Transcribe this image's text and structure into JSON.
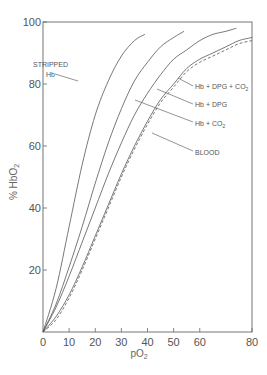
{
  "chart_data": {
    "type": "line",
    "title": "",
    "xlabel": "pO2",
    "ylabel": "% HbO2",
    "xlim": [
      0,
      80
    ],
    "ylim": [
      0,
      100
    ],
    "x_ticks": [
      0,
      10,
      20,
      30,
      40,
      50,
      60,
      80
    ],
    "y_ticks": [
      20,
      40,
      60,
      80,
      100
    ],
    "grid": false,
    "series": [
      {
        "name": "STRIPPED Hb",
        "style": "solid",
        "x": [
          0,
          5,
          10,
          15,
          20,
          25,
          30,
          35,
          39
        ],
        "y": [
          0,
          14,
          34,
          54,
          70,
          81,
          89,
          94,
          96
        ]
      },
      {
        "name": "Hb + CO2",
        "style": "solid",
        "x": [
          0,
          5,
          10,
          15,
          20,
          25,
          30,
          35,
          40,
          45,
          50,
          54
        ],
        "y": [
          0,
          9,
          21,
          34,
          48,
          61,
          72,
          81,
          87,
          92,
          95,
          97
        ]
      },
      {
        "name": "Hb + DPG",
        "style": "solid",
        "x": [
          0,
          5,
          10,
          15,
          20,
          25,
          30,
          35,
          40,
          45,
          50,
          55,
          60,
          65,
          70,
          74
        ],
        "y": [
          0,
          8,
          18,
          29,
          40,
          51,
          61,
          70,
          77,
          83,
          88,
          91,
          94,
          96,
          97,
          98
        ]
      },
      {
        "name": "Hb + DPG + CO2",
        "style": "solid",
        "x": [
          0,
          5,
          10,
          15,
          20,
          25,
          30,
          35,
          40,
          45,
          50,
          55,
          60,
          65,
          70,
          75,
          80
        ],
        "y": [
          0,
          5,
          12,
          21,
          31,
          41,
          51,
          60,
          68,
          75,
          80,
          85,
          88,
          90,
          92,
          94,
          95
        ]
      },
      {
        "name": "BLOOD",
        "style": "dashed",
        "x": [
          0,
          5,
          10,
          15,
          20,
          25,
          30,
          35,
          40,
          45,
          50,
          55,
          60,
          65,
          70,
          75,
          80
        ],
        "y": [
          0,
          4,
          11,
          20,
          30,
          40,
          50,
          59,
          67,
          74,
          79,
          84,
          87,
          89,
          91,
          93,
          94
        ]
      }
    ],
    "annotations": [
      {
        "text": "STRIPPED",
        "target": "STRIPPED Hb"
      },
      {
        "text": "Hb",
        "target": "STRIPPED Hb"
      },
      {
        "text": "Hb + DPG + CO2",
        "target": "Hb + DPG + CO2"
      },
      {
        "text": "Hb + DPG",
        "target": "Hb + DPG"
      },
      {
        "text": "Hb + CO2",
        "target": "Hb + CO2"
      },
      {
        "text": "BLOOD",
        "target": "BLOOD"
      }
    ]
  },
  "labels": {
    "x_axis_title": "pO",
    "x_axis_sub": "2",
    "y_axis_title": "% HbO",
    "y_axis_sub": "2",
    "stripped_line1": "STRIPPED",
    "stripped_line2": "Hb",
    "dpg_co2": "Hb + DPG + CO",
    "dpg_co2_sub": "2",
    "dpg": "Hb + DPG",
    "co2": "Hb + CO",
    "co2_sub": "2",
    "blood": "BLOOD"
  }
}
